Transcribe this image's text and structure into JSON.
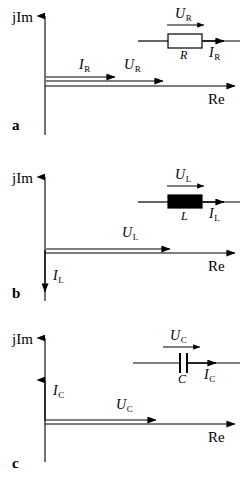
{
  "figure": {
    "axis_labels": {
      "imaginary": "jIm",
      "real": "Re"
    },
    "stroke_color": "#000000",
    "background_color": "#ffffff"
  },
  "panels": [
    {
      "id": "a",
      "letter": "a",
      "element": "resistor",
      "component_label": "R",
      "voltage_label": "U",
      "voltage_sub": "R",
      "current_label": "I",
      "current_sub": "R",
      "schematic": {
        "symbol": "open-rectangle",
        "voltage_arrow_label": "U",
        "voltage_arrow_sub": "R",
        "current_arrow_label": "I",
        "current_arrow_sub": "R",
        "designator": "R"
      },
      "phasors": [
        {
          "name": "I",
          "sub": "R",
          "direction": "positive-real",
          "angle_deg": 0,
          "length_px": 70
        },
        {
          "name": "U",
          "sub": "R",
          "direction": "positive-real",
          "angle_deg": 0,
          "length_px": 118
        }
      ],
      "phase_relation": "in phase"
    },
    {
      "id": "b",
      "letter": "b",
      "element": "inductor",
      "component_label": "L",
      "voltage_label": "U",
      "voltage_sub": "L",
      "current_label": "I",
      "current_sub": "L",
      "schematic": {
        "symbol": "filled-rectangle",
        "voltage_arrow_label": "U",
        "voltage_arrow_sub": "L",
        "current_arrow_label": "I",
        "current_arrow_sub": "L",
        "designator": "L"
      },
      "phasors": [
        {
          "name": "U",
          "sub": "L",
          "direction": "positive-real",
          "angle_deg": 0,
          "length_px": 125
        },
        {
          "name": "I",
          "sub": "L",
          "direction": "negative-imaginary",
          "angle_deg": -90,
          "length_px": 42
        }
      ],
      "phase_relation": "current lags voltage by 90 degrees"
    },
    {
      "id": "c",
      "letter": "c",
      "element": "capacitor",
      "component_label": "C",
      "voltage_label": "U",
      "voltage_sub": "C",
      "current_label": "I",
      "current_sub": "C",
      "schematic": {
        "symbol": "parallel-plates",
        "voltage_arrow_label": "U",
        "voltage_arrow_sub": "C",
        "current_arrow_label": "I",
        "current_arrow_sub": "C",
        "designator": "C"
      },
      "phasors": [
        {
          "name": "U",
          "sub": "C",
          "direction": "positive-real",
          "angle_deg": 0,
          "length_px": 110
        },
        {
          "name": "I",
          "sub": "C",
          "direction": "positive-imaginary",
          "angle_deg": 90,
          "length_px": 42
        }
      ],
      "phase_relation": "current leads voltage by 90 degrees"
    }
  ]
}
